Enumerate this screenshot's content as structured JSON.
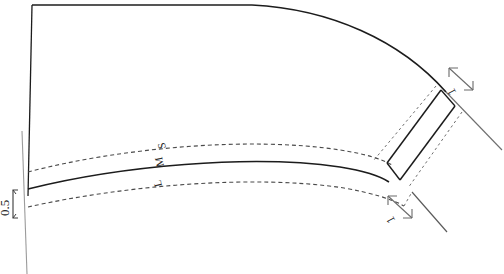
{
  "drawing": {
    "type": "technical-line-drawing",
    "background_color": "#ffffff",
    "stroke_color": "#1c1c1c",
    "dashed_color": "#4a4a4a",
    "thin_color": "#8a8a8a",
    "annotations": {
      "width_dimension": {
        "value": "0.5",
        "orientation": "vertical-rotated",
        "position": "left-lower"
      },
      "radial_dimension_top": {
        "value": "1",
        "orientation": "rotated",
        "position": "upper-right"
      },
      "radial_dimension_bottom": {
        "value": "1",
        "orientation": "rotated",
        "position": "lower-right"
      }
    },
    "curve_labels": {
      "outer": "S",
      "middle": "M",
      "inner": "L",
      "combined": "L M S",
      "orientation": "rotated-along-curve",
      "position": "mid-band"
    }
  }
}
